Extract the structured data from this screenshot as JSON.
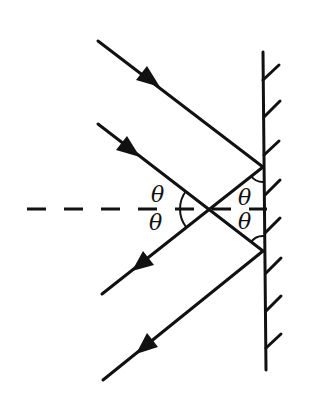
{
  "diagram": {
    "colors": {
      "ink": "#111111",
      "background": "#ffffff"
    },
    "labels": {
      "angle_left_upper": "θ",
      "angle_left_lower": "θ",
      "angle_right_upper": "θ",
      "angle_right_lower": "θ"
    },
    "elements": {
      "mirror": {
        "x1": 263,
        "y1": 52,
        "x2": 266,
        "y2": 370
      },
      "hatch_count": 8,
      "incident_rays": [
        {
          "from": [
            98,
            41
          ],
          "to": [
            263,
            167
          ]
        },
        {
          "from": [
            98,
            124
          ],
          "to": [
            263,
            251
          ]
        }
      ],
      "reflected_rays": [
        {
          "from": [
            263,
            167
          ],
          "to": [
            102,
            294
          ]
        },
        {
          "from": [
            263,
            251
          ],
          "to": [
            103,
            380
          ]
        }
      ],
      "normal_line": {
        "from": [
          27,
          209
        ],
        "to": [
          267,
          209
        ],
        "style": "dashed"
      },
      "intersection_point": [
        210,
        209
      ]
    }
  }
}
